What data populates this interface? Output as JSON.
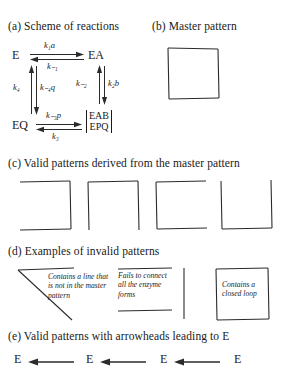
{
  "figure": {
    "background_color": "#ffffff",
    "ink_color": "#2b2b2b"
  },
  "panels": {
    "a": {
      "caption": "(a) Scheme of reactions",
      "nodes": {
        "top_left": "E",
        "top_right": "EA",
        "bottom_left": "EQ",
        "bottom_right_line1": "EAB",
        "bottom_right_line2": "EPQ"
      },
      "rates": {
        "top_forward": "k₁a",
        "top_reverse": "k₋₁",
        "left_up": "k₄",
        "left_down": "k₋₄q",
        "right_up": "k₋₂",
        "right_down": "k₂b",
        "bottom_forward": "k₋₃p",
        "bottom_reverse": "k₃"
      }
    },
    "b": {
      "caption": "(b) Master pattern",
      "shape": "complete-square"
    },
    "c": {
      "caption": "(c) Valid patterns derived from the master pattern",
      "patterns": [
        {
          "name": "pattern-missing-left",
          "missing_side": "left"
        },
        {
          "name": "pattern-missing-bottom",
          "missing_side": "bottom"
        },
        {
          "name": "pattern-missing-right",
          "missing_side": "right"
        },
        {
          "name": "pattern-missing-top",
          "missing_side": "top"
        }
      ]
    },
    "d": {
      "caption": "(d) Examples of invalid patterns",
      "examples": [
        {
          "name": "invalid-extra-line",
          "note": "Contains a line that is not in the master pattern"
        },
        {
          "name": "invalid-disconnected",
          "note": "Fails to connect all the enzyme forms"
        },
        {
          "name": "invalid-closed-loop",
          "note": "Contains a closed loop"
        }
      ]
    },
    "e": {
      "caption": "(e) Valid patterns with arrowheads leading to E",
      "items": [
        {
          "name": "arrow-pattern-1",
          "label": "E"
        },
        {
          "name": "arrow-pattern-2",
          "label": "E"
        },
        {
          "name": "arrow-pattern-3",
          "label": "E"
        },
        {
          "name": "arrow-pattern-4",
          "label": "E"
        }
      ]
    }
  }
}
